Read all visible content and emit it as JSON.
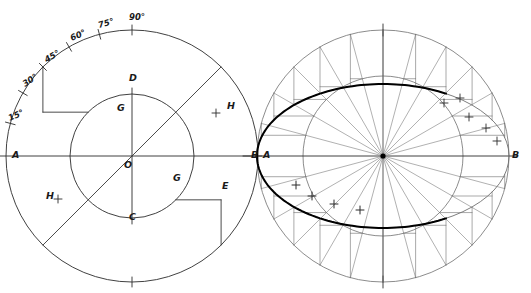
{
  "drawing": {
    "title": "Ellipse construction by concentric circles",
    "ink_color": "#2b2b2b",
    "thin_color": "#6f6f6f",
    "bold_color": "#000000",
    "background": "#ffffff"
  },
  "left_panel": {
    "name": "angle-division-diagram",
    "center": {
      "cx": 132,
      "cy": 156,
      "label": "O"
    },
    "outer_circle": {
      "radius": 126
    },
    "inner_circle": {
      "radius": 62
    },
    "axis_endpoints": {
      "left_label": "A",
      "right_label": "B"
    },
    "vertical_endpoints": {
      "top_label": "D",
      "bottom_label": "C"
    },
    "angle_labels": [
      {
        "text": "15°",
        "deg": 165,
        "x": 10,
        "y": 115
      },
      {
        "text": "30°",
        "deg": 150,
        "x": 24,
        "y": 80
      },
      {
        "text": "45°",
        "deg": 135,
        "x": 46,
        "y": 56
      },
      {
        "text": "60°",
        "deg": 120,
        "x": 72,
        "y": 34
      },
      {
        "text": "75°",
        "deg": 105,
        "x": 100,
        "y": 23
      },
      {
        "text": "90°",
        "deg": 90,
        "x": 131,
        "y": 17
      }
    ],
    "tick_angles_deg": [
      165,
      150,
      135,
      120,
      105,
      90,
      270
    ],
    "diagonal_angle_deg": 45,
    "point_labels": [
      {
        "text": "G",
        "x": 117,
        "y": 107,
        "role": "inner-upper-left"
      },
      {
        "text": "G",
        "x": 173,
        "y": 177,
        "role": "inner-lower-right"
      },
      {
        "text": "E",
        "x": 222,
        "y": 185,
        "role": "projection-corner"
      },
      {
        "text": "H",
        "x": 227,
        "y": 105,
        "role": "upper-right-mark"
      },
      {
        "text": "H",
        "x": 46,
        "y": 195,
        "role": "lower-left-mark"
      }
    ],
    "plus_marks": [
      {
        "x": 216,
        "y": 113
      },
      {
        "x": 58,
        "y": 199
      }
    ]
  },
  "right_panel": {
    "name": "ellipse-construction-diagram",
    "center": {
      "cx": 383,
      "cy": 156
    },
    "outer_circle": {
      "radius": 126
    },
    "inner_circle": {
      "radius": 80
    },
    "axis_endpoints": {
      "left_label": "A",
      "right_label": "B"
    },
    "ellipse": {
      "semi_major": 126,
      "semi_minor": 72
    },
    "ray_step_deg": 15,
    "tick_angles_deg": [
      90,
      270
    ],
    "plus_marks_field": [
      {
        "x": 460,
        "y": 98
      },
      {
        "x": 444,
        "y": 103
      },
      {
        "x": 469,
        "y": 117
      },
      {
        "x": 486,
        "y": 128
      },
      {
        "x": 497,
        "y": 141
      }
    ],
    "plus_marks_curve": [
      {
        "x": 296,
        "y": 185
      },
      {
        "x": 312,
        "y": 196
      },
      {
        "x": 334,
        "y": 204
      },
      {
        "x": 360,
        "y": 210
      }
    ]
  }
}
